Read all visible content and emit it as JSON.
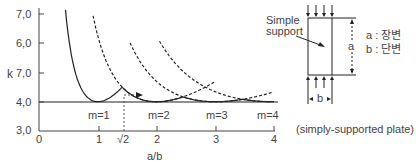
{
  "chart_data": {
    "type": "line",
    "title": "",
    "xlabel": "a/b",
    "ylabel": "k",
    "xlim": [
      0,
      4
    ],
    "ylim": [
      3.0,
      7.0
    ],
    "x_ticks": [
      "0",
      "1",
      "√2",
      "2",
      "3",
      "4"
    ],
    "y_ticks": [
      "3,0",
      "4,0",
      "7,0",
      "6,0",
      "7,0"
    ],
    "grid": false,
    "formula": "k = (m·b/a + a/(m·b))^2",
    "series": [
      {
        "name": "m=1",
        "style": "solid",
        "min_at": 1.0,
        "min_k": 4.0,
        "x": [
          0.45,
          0.5,
          0.6,
          0.7,
          0.8,
          0.9,
          1.0,
          1.2,
          1.414,
          1.6,
          2.0,
          2.5,
          3.0,
          3.5,
          4.0
        ],
        "k": [
          6.96,
          6.25,
          5.14,
          4.53,
          4.2,
          4.05,
          4.0,
          4.11,
          4.5,
          4.28,
          4.1,
          4.04,
          4.02,
          4.01,
          4.0
        ]
      },
      {
        "name": "m=2",
        "style": "dashed",
        "min_at": 2.0,
        "min_k": 4.0,
        "x": [
          0.95,
          1.0,
          1.2,
          1.414,
          1.6,
          2.0,
          2.449,
          3.0
        ],
        "k": [
          7.1,
          6.25,
          5.14,
          4.5,
          4.28,
          4.0,
          4.17,
          4.69
        ]
      },
      {
        "name": "m=3",
        "style": "dashed",
        "min_at": 3.0,
        "min_k": 4.0,
        "x": [
          1.6,
          2.0,
          2.449,
          3.0,
          3.464,
          4.0
        ],
        "k": [
          6.6,
          5.14,
          4.5,
          4.0,
          4.08,
          4.34
        ]
      },
      {
        "name": "m=4",
        "style": "dashed",
        "min_at": 4.0,
        "min_k": 4.0,
        "x": [
          2.1,
          2.5,
          3.0,
          3.464,
          4.0
        ],
        "k": [
          6.9,
          5.6,
          4.69,
          4.08,
          4.0
        ]
      }
    ],
    "reference_line": {
      "k": 4.0,
      "label": "k = 4.0"
    },
    "annotations": [
      "m=1",
      "m=2",
      "m=3",
      "m=4",
      "√2"
    ]
  },
  "diagram": {
    "support_label_line1": "Simple",
    "support_label_line2": "support",
    "dim_a": "a",
    "dim_b": "b",
    "legend_a": "a : 장변",
    "legend_b": "b : 단변",
    "caption": "(simply-supported plate)"
  },
  "axis": {
    "ylabel": "k",
    "xlabel": "a/b",
    "y_ticks": [
      "7,0",
      "6,0",
      "7,0",
      "4,0",
      "3,0"
    ],
    "x_ticks": [
      "0",
      "1",
      "√2",
      "2",
      "3",
      "4"
    ],
    "mode_labels": [
      "m=1",
      "m=2",
      "m=3",
      "m=4"
    ]
  }
}
